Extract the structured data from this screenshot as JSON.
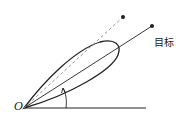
{
  "diagram": {
    "labels": {
      "origin": "O",
      "target": "目标"
    },
    "colors": {
      "stroke": "#222222",
      "dashed": "#888888",
      "background": "#ffffff"
    }
  }
}
